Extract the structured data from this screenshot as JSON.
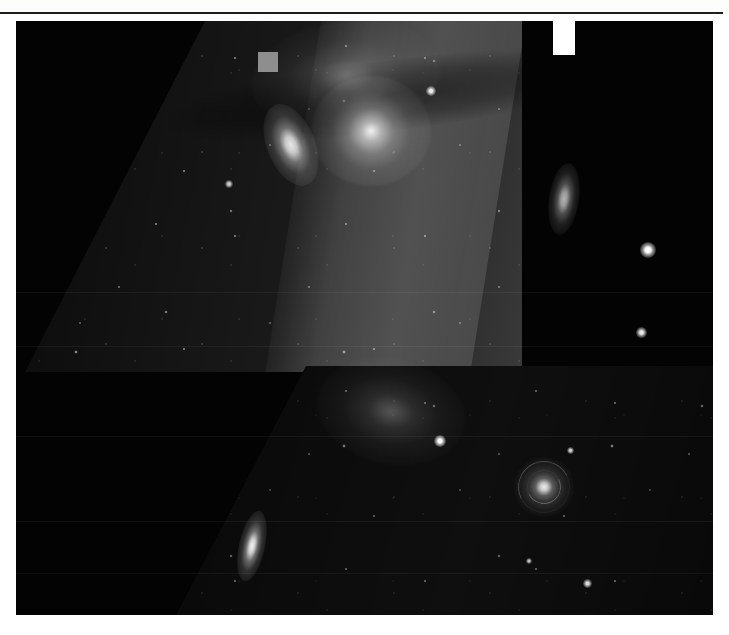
{
  "document": {
    "kind": "astronomical-plate",
    "caption": "",
    "background_color": "#ffffff",
    "plate_color": "#030303"
  },
  "plate": {
    "label": "astronomical-image-plate",
    "left": 16,
    "top": 21,
    "width": 697,
    "height": 594
  },
  "panels": [
    {
      "name": "upper-exposure-panel",
      "description": "Brighter sheared star-field exposure, upper portion",
      "brightness": "bright",
      "shape": "parallelogram"
    },
    {
      "name": "lower-exposure-panel",
      "description": "Darker sheared star-field exposure, lower portion",
      "brightness": "dark",
      "shape": "parallelogram"
    }
  ],
  "overlays": {
    "marker_square": {
      "name": "gray-square-marker",
      "color": "#8e8e8e",
      "x": 242,
      "y": 31,
      "width": 20,
      "height": 20
    },
    "notch_tab": {
      "name": "white-notch-tab",
      "color": "#ffffff",
      "x": 537,
      "y": 0,
      "width": 22,
      "height": 34
    }
  },
  "objects": [
    {
      "id": "galaxy-upper-left",
      "name": "edge-on-galaxy",
      "type": "galaxy-edge",
      "x": 275,
      "y": 124,
      "w": 48,
      "h": 86,
      "rot": -22,
      "brightness": 0.9
    },
    {
      "id": "cluster-core",
      "name": "bright-star-cluster",
      "type": "cluster",
      "x": 355,
      "y": 110,
      "w": 120,
      "h": 110,
      "rot": 0,
      "brightness": 1.0
    },
    {
      "id": "nebula-upper",
      "name": "emission-nebula",
      "type": "nebula",
      "x": 330,
      "y": 55,
      "w": 190,
      "h": 110,
      "rot": -8,
      "brightness": 0.6
    },
    {
      "id": "galaxy-right-edge",
      "name": "edge-on-galaxy-right",
      "type": "galaxy-edge",
      "x": 548,
      "y": 178,
      "w": 30,
      "h": 72,
      "rot": 8,
      "brightness": 0.7
    },
    {
      "id": "star-bright-right-1",
      "name": "bright-field-star",
      "type": "star",
      "x": 632,
      "y": 229,
      "w": 16,
      "h": 16,
      "rot": 0,
      "brightness": 1.0
    },
    {
      "id": "star-bright-right-2",
      "name": "bright-field-star",
      "type": "star",
      "x": 625,
      "y": 311,
      "w": 11,
      "h": 11,
      "rot": 0,
      "brightness": 0.9
    },
    {
      "id": "star-upper-mid",
      "name": "bright-field-star",
      "type": "star",
      "x": 415,
      "y": 70,
      "w": 10,
      "h": 10,
      "rot": 0,
      "brightness": 0.9
    },
    {
      "id": "star-upper-left",
      "name": "bright-field-star",
      "type": "star",
      "x": 213,
      "y": 163,
      "w": 8,
      "h": 8,
      "rot": 0,
      "brightness": 0.8
    },
    {
      "id": "nebula-lower",
      "name": "star-forming-region",
      "type": "nebula",
      "x": 375,
      "y": 390,
      "w": 150,
      "h": 105,
      "rot": 12,
      "brightness": 0.55
    },
    {
      "id": "knot-lower",
      "name": "nebula-bright-knot",
      "type": "star",
      "x": 424,
      "y": 420,
      "w": 12,
      "h": 12,
      "rot": 0,
      "brightness": 1.0
    },
    {
      "id": "galaxy-spiral-main",
      "name": "face-on-spiral-galaxy",
      "type": "galaxy-spiral",
      "x": 528,
      "y": 466,
      "w": 62,
      "h": 62,
      "rot": 18,
      "brightness": 0.95
    },
    {
      "id": "galaxy-edge-lower",
      "name": "edge-on-spiral-galaxy",
      "type": "galaxy-edge",
      "x": 236,
      "y": 525,
      "w": 26,
      "h": 72,
      "rot": 12,
      "brightness": 0.95
    },
    {
      "id": "star-lower-1",
      "name": "bright-field-star",
      "type": "star",
      "x": 571,
      "y": 562,
      "w": 9,
      "h": 9,
      "rot": 0,
      "brightness": 0.85
    },
    {
      "id": "star-lower-2",
      "name": "bright-field-star",
      "type": "star",
      "x": 554,
      "y": 429,
      "w": 7,
      "h": 7,
      "rot": 0,
      "brightness": 0.8
    },
    {
      "id": "star-lower-3",
      "name": "bright-field-star",
      "type": "star",
      "x": 513,
      "y": 540,
      "w": 6,
      "h": 6,
      "rot": 0,
      "brightness": 0.75
    }
  ],
  "seams": [
    271,
    325,
    415,
    500,
    552
  ],
  "frame": {
    "rule_top_color": "#1d1d1d",
    "rule_right_color": "#2a2a2a"
  }
}
